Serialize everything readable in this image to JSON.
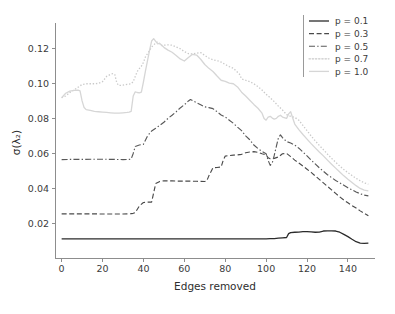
{
  "chart_data": {
    "type": "line",
    "title": "",
    "xlabel": "Edges removed",
    "ylabel": "σ(λ₂)",
    "xlim": [
      -3,
      153
    ],
    "ylim": [
      0.0,
      0.1325
    ],
    "grid": false,
    "legend_position": "upper right",
    "xticks": [
      0,
      20,
      40,
      60,
      80,
      100,
      120,
      140
    ],
    "xtick_labels": [
      "0",
      "20",
      "40",
      "60",
      "80",
      "100",
      "120",
      "140"
    ],
    "yticks": [
      0.02,
      0.04,
      0.06,
      0.08,
      0.1,
      0.12
    ],
    "ytick_labels": [
      "0.02",
      "0.04",
      "0.06",
      "0.08",
      "0.10",
      "0.12"
    ],
    "series": [
      {
        "name": "p = 0.1",
        "legend_label": "p = 0.1",
        "color": "#2b2b2b",
        "linestyle": "solid",
        "dasharray": "",
        "width": 1.3,
        "x": [
          0,
          5,
          10,
          15,
          20,
          25,
          30,
          35,
          40,
          45,
          50,
          55,
          60,
          65,
          70,
          75,
          80,
          85,
          90,
          95,
          98,
          100,
          102,
          104,
          106,
          108,
          110,
          111,
          112,
          114,
          116,
          118,
          120,
          122,
          124,
          126,
          128,
          130,
          132,
          134,
          136,
          138,
          140,
          142,
          144,
          146,
          148,
          150
        ],
        "y": [
          0.0112,
          0.0112,
          0.0112,
          0.0112,
          0.0112,
          0.0112,
          0.0112,
          0.0112,
          0.0112,
          0.0112,
          0.0112,
          0.0112,
          0.0112,
          0.0112,
          0.0112,
          0.0112,
          0.0112,
          0.0112,
          0.0112,
          0.0112,
          0.0112,
          0.0112,
          0.0113,
          0.0114,
          0.0116,
          0.0118,
          0.012,
          0.0142,
          0.0148,
          0.015,
          0.0151,
          0.0153,
          0.0153,
          0.0152,
          0.015,
          0.0151,
          0.0157,
          0.0158,
          0.0158,
          0.0157,
          0.015,
          0.0138,
          0.0125,
          0.011,
          0.0096,
          0.0088,
          0.0086,
          0.0088
        ]
      },
      {
        "name": "p = 0.3",
        "legend_label": "p = 0.3",
        "color": "#4a4a4a",
        "linestyle": "dashed",
        "dasharray": "5,2.6",
        "width": 1.15,
        "x": [
          0,
          5,
          10,
          15,
          20,
          25,
          30,
          34,
          35,
          36,
          38,
          40,
          42,
          44,
          46,
          48,
          50,
          54,
          58,
          62,
          66,
          70,
          71,
          72,
          74,
          76,
          78,
          79,
          80,
          82,
          84,
          86,
          88,
          90,
          92,
          94,
          96,
          98,
          100,
          101,
          102,
          104,
          106,
          108,
          110,
          112,
          114,
          116,
          118,
          120,
          122,
          124,
          126,
          128,
          130,
          132,
          134,
          136,
          138,
          140,
          142,
          144,
          146,
          148,
          150
        ],
        "y": [
          0.0255,
          0.0255,
          0.0255,
          0.0255,
          0.0254,
          0.0254,
          0.0254,
          0.0256,
          0.0258,
          0.0262,
          0.03,
          0.032,
          0.0322,
          0.0322,
          0.0428,
          0.044,
          0.0444,
          0.0443,
          0.0442,
          0.0442,
          0.0441,
          0.044,
          0.0444,
          0.0472,
          0.0518,
          0.052,
          0.0522,
          0.056,
          0.0585,
          0.0588,
          0.059,
          0.0592,
          0.0595,
          0.0604,
          0.0608,
          0.061,
          0.0606,
          0.0598,
          0.0592,
          0.0575,
          0.057,
          0.0572,
          0.058,
          0.0598,
          0.06,
          0.0582,
          0.0562,
          0.0545,
          0.0528,
          0.051,
          0.0492,
          0.0472,
          0.0452,
          0.0432,
          0.0412,
          0.0392,
          0.0372,
          0.0352,
          0.0334,
          0.0318,
          0.0302,
          0.0288,
          0.0272,
          0.0258,
          0.0244
        ]
      },
      {
        "name": "p = 0.5",
        "legend_label": "p = 0.5",
        "color": "#595959",
        "linestyle": "dashdot",
        "dasharray": "6,2.2,1.4,2.2",
        "width": 1.15,
        "x": [
          0,
          5,
          10,
          15,
          20,
          25,
          30,
          33,
          34,
          35,
          36,
          38,
          40,
          42,
          44,
          46,
          48,
          50,
          52,
          54,
          56,
          58,
          60,
          62,
          63,
          64,
          66,
          68,
          70,
          72,
          74,
          76,
          78,
          80,
          82,
          84,
          86,
          88,
          90,
          92,
          94,
          96,
          98,
          100,
          101,
          102,
          103,
          104,
          105,
          106,
          107,
          108,
          110,
          112,
          114,
          116,
          118,
          120,
          122,
          124,
          126,
          128,
          130,
          132,
          134,
          136,
          138,
          140,
          142,
          144,
          146,
          148,
          150
        ],
        "y": [
          0.0565,
          0.0566,
          0.0566,
          0.0567,
          0.0567,
          0.0566,
          0.0565,
          0.0566,
          0.0568,
          0.06,
          0.064,
          0.0648,
          0.0652,
          0.07,
          0.0728,
          0.0744,
          0.076,
          0.0778,
          0.08,
          0.0818,
          0.0838,
          0.086,
          0.0878,
          0.09,
          0.0908,
          0.0902,
          0.089,
          0.0878,
          0.0866,
          0.0862,
          0.0856,
          0.0838,
          0.082,
          0.0808,
          0.079,
          0.0772,
          0.075,
          0.073,
          0.07,
          0.0678,
          0.0648,
          0.0628,
          0.0612,
          0.0598,
          0.056,
          0.0532,
          0.0546,
          0.059,
          0.064,
          0.0688,
          0.0706,
          0.069,
          0.0668,
          0.066,
          0.0648,
          0.063,
          0.0608,
          0.0586,
          0.0562,
          0.054,
          0.0518,
          0.0498,
          0.0478,
          0.0462,
          0.0446,
          0.0432,
          0.0418,
          0.0404,
          0.0392,
          0.038,
          0.037,
          0.0362,
          0.0358
        ]
      },
      {
        "name": "p = 0.7",
        "legend_label": "p = 0.7",
        "color": "#c9c9c9",
        "linestyle": "dotted",
        "dasharray": "1.4,1.8",
        "width": 1.3,
        "x": [
          0,
          2,
          4,
          6,
          8,
          10,
          12,
          14,
          16,
          18,
          20,
          22,
          24,
          25,
          26,
          27,
          28,
          30,
          32,
          34,
          35,
          36,
          37,
          38,
          39,
          40,
          41,
          42,
          43,
          44,
          45,
          46,
          47,
          48,
          49,
          50,
          52,
          54,
          56,
          58,
          60,
          62,
          64,
          66,
          68,
          70,
          72,
          74,
          76,
          78,
          80,
          82,
          84,
          86,
          87,
          88,
          90,
          92,
          94,
          96,
          98,
          100,
          102,
          104,
          106,
          108,
          110,
          112,
          114,
          116,
          118,
          120,
          122,
          124,
          126,
          128,
          130,
          132,
          134,
          136,
          138,
          140,
          142,
          144,
          146,
          148,
          150
        ],
        "y": [
          0.0918,
          0.0928,
          0.0948,
          0.0962,
          0.0978,
          0.0994,
          0.0998,
          0.0998,
          0.0998,
          0.1,
          0.101,
          0.104,
          0.1052,
          0.1056,
          0.105,
          0.1002,
          0.0988,
          0.099,
          0.0995,
          0.0998,
          0.101,
          0.104,
          0.1068,
          0.1085,
          0.1098,
          0.112,
          0.1152,
          0.117,
          0.1188,
          0.1208,
          0.1218,
          0.1232,
          0.1238,
          0.1224,
          0.1216,
          0.1218,
          0.122,
          0.1218,
          0.1208,
          0.1198,
          0.1182,
          0.117,
          0.1168,
          0.1172,
          0.1176,
          0.116,
          0.1145,
          0.1135,
          0.113,
          0.1122,
          0.1108,
          0.1096,
          0.1086,
          0.1064,
          0.1052,
          0.1026,
          0.1018,
          0.101,
          0.0998,
          0.0982,
          0.0962,
          0.0938,
          0.0918,
          0.0896,
          0.087,
          0.0848,
          0.0822,
          0.0812,
          0.0806,
          0.079,
          0.076,
          0.073,
          0.07,
          0.0672,
          0.0646,
          0.0622,
          0.0596,
          0.0572,
          0.055,
          0.0528,
          0.0508,
          0.049,
          0.0474,
          0.0458,
          0.0444,
          0.0432,
          0.0424
        ]
      },
      {
        "name": "p = 1.0",
        "legend_label": "p = 1.0",
        "color": "#d6d6d6",
        "linestyle": "solid",
        "dasharray": "",
        "width": 1.3,
        "x": [
          0,
          2,
          4,
          6,
          8,
          9,
          10,
          11,
          12,
          14,
          16,
          18,
          20,
          22,
          24,
          26,
          28,
          30,
          32,
          33,
          34,
          35,
          36,
          37,
          38,
          39,
          40,
          41,
          42,
          43,
          44,
          45,
          46,
          47,
          48,
          50,
          52,
          54,
          56,
          58,
          60,
          62,
          64,
          66,
          68,
          70,
          72,
          74,
          76,
          78,
          80,
          82,
          84,
          86,
          88,
          90,
          92,
          94,
          96,
          98,
          99,
          100,
          101,
          102,
          103,
          104,
          105,
          106,
          107,
          108,
          110,
          111,
          112,
          113,
          114,
          116,
          118,
          120,
          122,
          124,
          126,
          128,
          130,
          132,
          134,
          136,
          138,
          140,
          142,
          144,
          146,
          148,
          150
        ],
        "y": [
          0.0918,
          0.0944,
          0.0956,
          0.096,
          0.0962,
          0.0958,
          0.09,
          0.0862,
          0.085,
          0.0846,
          0.084,
          0.0838,
          0.0836,
          0.0834,
          0.0832,
          0.083,
          0.083,
          0.0832,
          0.0834,
          0.0836,
          0.084,
          0.0928,
          0.0952,
          0.0948,
          0.0946,
          0.095,
          0.1008,
          0.1072,
          0.113,
          0.1188,
          0.1242,
          0.1256,
          0.124,
          0.1226,
          0.1228,
          0.1206,
          0.119,
          0.1178,
          0.116,
          0.114,
          0.1128,
          0.1148,
          0.1166,
          0.1162,
          0.1138,
          0.1108,
          0.1086,
          0.1068,
          0.1042,
          0.1018,
          0.1012,
          0.1002,
          0.0998,
          0.098,
          0.095,
          0.0928,
          0.0904,
          0.088,
          0.0858,
          0.083,
          0.08,
          0.079,
          0.0808,
          0.0812,
          0.0802,
          0.0796,
          0.08,
          0.0812,
          0.0818,
          0.0808,
          0.08,
          0.0826,
          0.0838,
          0.0802,
          0.0768,
          0.0736,
          0.0708,
          0.0682,
          0.0656,
          0.0632,
          0.0608,
          0.0586,
          0.0562,
          0.0538,
          0.0516,
          0.0494,
          0.0472,
          0.0452,
          0.0434,
          0.0416,
          0.04,
          0.039,
          0.0386
        ]
      }
    ]
  },
  "axes": {
    "xlabel": "Edges removed",
    "ylabel": "σ(λ₂)"
  }
}
